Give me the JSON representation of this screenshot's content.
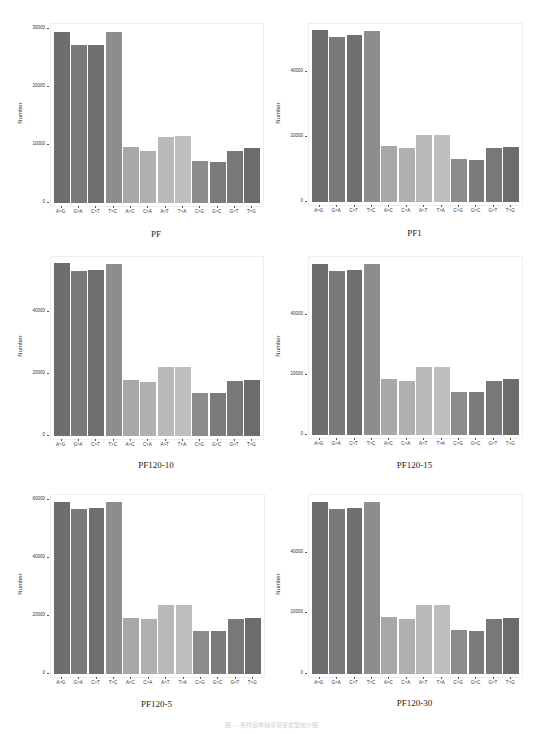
{
  "chart_data": [
    {
      "type": "bar",
      "title": "PF",
      "xlabel": "",
      "ylabel": "Number",
      "ylim": [
        0,
        30500
      ],
      "yticks": [
        0,
        10000,
        20000,
        30000
      ],
      "grid": false,
      "categories": [
        "A->G",
        "G->A",
        "C->T",
        "T->C",
        "A->C",
        "C->A",
        "A->T",
        "T->A",
        "C->G",
        "G->C",
        "G->T",
        "T->G"
      ],
      "values": [
        29400,
        27200,
        27200,
        29400,
        9600,
        9000,
        11400,
        11600,
        7300,
        7100,
        8900,
        9500
      ]
    },
    {
      "type": "bar",
      "title": "PF1",
      "xlabel": "",
      "ylabel": "Number",
      "ylim": [
        0,
        54000
      ],
      "yticks": [
        0,
        20000,
        40000
      ],
      "grid": false,
      "categories": [
        "A->G",
        "G->A",
        "C->T",
        "T->C",
        "A->C",
        "C->A",
        "A->T",
        "T->A",
        "C->G",
        "G->C",
        "G->T",
        "T->G"
      ],
      "values": [
        52800,
        50600,
        51200,
        52600,
        17100,
        16500,
        20700,
        20700,
        13200,
        13000,
        16700,
        16900
      ]
    },
    {
      "type": "bar",
      "title": "PF120-10",
      "xlabel": "",
      "ylabel": "Number",
      "ylim": [
        0,
        57000
      ],
      "yticks": [
        0,
        20000,
        40000
      ],
      "grid": false,
      "categories": [
        "A->G",
        "G->A",
        "C->T",
        "T->C",
        "A->C",
        "C->A",
        "A->T",
        "T->A",
        "C->G",
        "G->C",
        "G->T",
        "T->G"
      ],
      "values": [
        55600,
        53200,
        53500,
        55400,
        18000,
        17400,
        22100,
        22100,
        13900,
        13800,
        17700,
        18000
      ]
    },
    {
      "type": "bar",
      "title": "PF120-15",
      "xlabel": "",
      "ylabel": "Number",
      "ylim": [
        0,
        58500
      ],
      "yticks": [
        0,
        20000,
        40000
      ],
      "grid": false,
      "categories": [
        "A->G",
        "G->A",
        "C->T",
        "T->C",
        "A->C",
        "C->A",
        "A->T",
        "T->A",
        "C->G",
        "G->C",
        "G->T",
        "T->G"
      ],
      "values": [
        56900,
        54600,
        54900,
        56800,
        18500,
        18000,
        22700,
        22700,
        14300,
        14200,
        18100,
        18500
      ]
    },
    {
      "type": "bar",
      "title": "PF120-5",
      "xlabel": "",
      "ylabel": "Number",
      "ylim": [
        0,
        61000
      ],
      "yticks": [
        0,
        20000,
        40000,
        60000
      ],
      "grid": false,
      "categories": [
        "A->G",
        "G->A",
        "C->T",
        "T->C",
        "A->C",
        "C->A",
        "A->T",
        "T->A",
        "C->G",
        "G->C",
        "G->T",
        "T->G"
      ],
      "values": [
        59200,
        56900,
        57100,
        59400,
        19400,
        19000,
        23900,
        23900,
        14800,
        14700,
        19000,
        19400
      ]
    },
    {
      "type": "bar",
      "title": "PF120-30",
      "xlabel": "",
      "ylabel": "Number",
      "ylim": [
        0,
        58500
      ],
      "yticks": [
        0,
        20000,
        40000
      ],
      "grid": false,
      "categories": [
        "A->G",
        "G->A",
        "C->T",
        "T->C",
        "A->C",
        "C->A",
        "A->T",
        "T->A",
        "C->G",
        "G->C",
        "G->T",
        "T->G"
      ],
      "values": [
        57000,
        54600,
        54800,
        56700,
        18700,
        18100,
        22700,
        22700,
        14400,
        14100,
        18100,
        18500
      ]
    }
  ],
  "bar_colors": [
    "#6e6e6e",
    "#7a7a7a",
    "#6f6f6f",
    "#8d8d8d",
    "#a8a8a8",
    "#b0b0b0",
    "#b9b9b9",
    "#bebebe",
    "#8c8c8c",
    "#7b7b7b",
    "#787878",
    "#6c6c6c"
  ],
  "x_tick_labels": [
    "A->G",
    "G->A",
    "C->T",
    "T->C",
    "A->C",
    "C->A",
    "A->T",
    "T->A",
    "C->G",
    "G->C",
    "G->T",
    "T->G"
  ],
  "caption": "图 — 各样品单碱基突变类型统计图"
}
